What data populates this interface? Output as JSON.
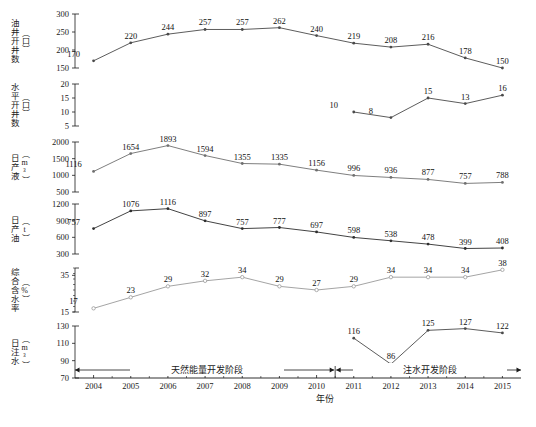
{
  "chart_data": {
    "type": "line",
    "title": "",
    "xlabel": "年份",
    "categories": [
      2004,
      2005,
      2006,
      2007,
      2008,
      2009,
      2010,
      2011,
      2012,
      2013,
      2014,
      2015
    ],
    "panels": [
      {
        "id": "oil-wells",
        "ylabel": "油井开井数",
        "yunit": "（口）",
        "ylim": [
          150,
          300
        ],
        "yticks": [
          150,
          200,
          250,
          300
        ],
        "values": [
          170,
          220,
          244,
          257,
          257,
          262,
          240,
          219,
          208,
          216,
          178,
          150
        ],
        "marker": "dot",
        "color": "#4a4a4a"
      },
      {
        "id": "horizontal-wells",
        "ylabel": "水平开井数",
        "yunit": "（口）",
        "ylim": [
          5,
          20
        ],
        "yticks": [
          5,
          10,
          15,
          20
        ],
        "values": [
          null,
          null,
          null,
          null,
          null,
          null,
          null,
          10,
          8,
          15,
          13,
          16
        ],
        "marker": "dot",
        "color": "#4a4a4a"
      },
      {
        "id": "daily-liquid",
        "ylabel": "日产液",
        "yunit": "（m³）",
        "ylim": [
          500,
          2000
        ],
        "yticks": [
          500,
          1000,
          1500,
          2000
        ],
        "values": [
          1116,
          1654,
          1893,
          1594,
          1355,
          1335,
          1156,
          996,
          936,
          877,
          757,
          788
        ],
        "marker": "dot",
        "color": "#6f6f6f"
      },
      {
        "id": "daily-oil",
        "ylabel": "日产油",
        "yunit": "（t）",
        "ylim": [
          300,
          1200
        ],
        "yticks": [
          300,
          600,
          900,
          1200
        ],
        "values": [
          757,
          1076,
          1116,
          897,
          757,
          777,
          697,
          598,
          538,
          478,
          399,
          408
        ],
        "marker": "dot",
        "color": "#2e2e2e"
      },
      {
        "id": "water-cut",
        "ylabel": "综合含水率",
        "yunit": "（%）",
        "ylim": [
          15,
          39
        ],
        "yticks": [
          15,
          35
        ],
        "values": [
          17,
          23,
          29,
          32,
          34,
          29,
          27,
          29,
          34,
          34,
          34,
          38
        ],
        "marker": "circle",
        "color": "#9a9a9a"
      },
      {
        "id": "daily-injection",
        "ylabel": "日注水",
        "yunit": "（m³）",
        "ylim": [
          70,
          130
        ],
        "yticks": [
          70,
          90,
          110,
          130
        ],
        "values": [
          null,
          null,
          null,
          null,
          null,
          null,
          null,
          116,
          86,
          125,
          127,
          122
        ],
        "marker": "dot",
        "color": "#4a4a4a"
      }
    ],
    "phases": [
      {
        "label": "天然能量开发阶段",
        "start": 2004,
        "end": 2010
      },
      {
        "label": "注水开发阶段",
        "start": 2011,
        "end": 2015
      }
    ],
    "grid": false,
    "legend": "none"
  }
}
